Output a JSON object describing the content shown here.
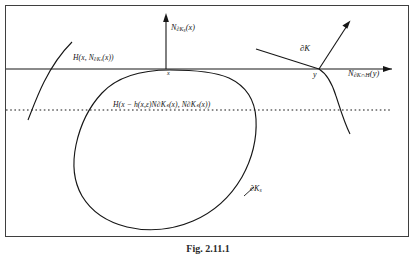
{
  "figure": {
    "caption": "Fig. 2.11.1",
    "frame_color": "#3a3a3a",
    "line_color": "#1a1a1a",
    "background": "#ffffff"
  },
  "labels": {
    "normal_at_x": "N∂Kₛ(x)",
    "hyperplane_at_x": "H(x, N∂Kₛ(x))",
    "point_x": "x",
    "hyperplane_shifted": "H(x − h(x,ε)N∂Kₛ(x), N∂Kₛ(x))",
    "boundary_k": "∂K",
    "point_y": "y",
    "normal_at_y": "N∂K∩H(y)",
    "boundary_k_s": "∂Kₛ"
  },
  "label_parts": {
    "normal_at_x": {
      "main": "N",
      "sub": "∂K",
      "subsub": "s",
      "arg": "(x)"
    },
    "hyperplane_at_x": {
      "pre": "H(x, N",
      "sub": "∂K",
      "subsub": "s",
      "post": "(x))"
    },
    "normal_at_y": {
      "main": "N",
      "sub": "∂K∩H",
      "arg": "(y)"
    },
    "boundary_k_s": {
      "main": "∂K",
      "sub": "s"
    }
  },
  "geometry": {
    "frame": {
      "x": 5,
      "y": 5,
      "width": 404,
      "height": 232
    },
    "solid_hyperplane_y": 69,
    "dotted_hyperplane_y": 110,
    "tangency_point": {
      "x": 170,
      "y": 70
    },
    "intersection_point_y": {
      "x": 319,
      "y": 69
    },
    "vertical_arrow": {
      "x": 166,
      "from_y": 69,
      "to_y": 14
    },
    "normal_arrow_y": {
      "from_x": 319,
      "from_y": 69,
      "to_x": 349,
      "to_y": 22
    },
    "horizontal_arrow_end_x": 392
  }
}
